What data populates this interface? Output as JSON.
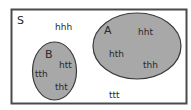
{
  "diagram": {
    "type": "venn",
    "universe": {
      "label": "S",
      "outside_items": [
        "hhh",
        "ttt"
      ]
    },
    "sets": [
      {
        "label": "A",
        "items": [
          "hht",
          "hth",
          "thh"
        ]
      },
      {
        "label": "B",
        "items": [
          "htt",
          "tth",
          "tht"
        ]
      }
    ],
    "colors": {
      "background": "#ffffff",
      "border": "#4a4a4a",
      "set_fill": "#a8a8a8",
      "set_stroke": "#3a3a3a",
      "text": "#2a2a2a"
    }
  }
}
